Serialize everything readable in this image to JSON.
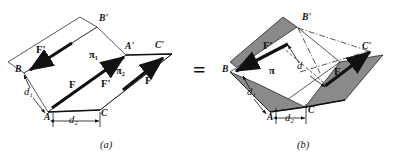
{
  "figure": {
    "type": "geometry-diagram",
    "relation_symbol": "=",
    "panels": [
      {
        "id": "a",
        "caption": "(a)",
        "planes": [
          {
            "name": "pi1",
            "label": "π₁"
          },
          {
            "name": "pi2",
            "label": "π₂"
          }
        ],
        "points": [
          {
            "label": "B'",
            "x": 100,
            "y": 20
          },
          {
            "label": "A'",
            "x": 127,
            "y": 48
          },
          {
            "label": "C'",
            "x": 156,
            "y": 47
          },
          {
            "label": "B",
            "x": 18,
            "y": 70
          },
          {
            "label": "A",
            "x": 46,
            "y": 113
          },
          {
            "label": "C",
            "x": 100,
            "y": 110
          }
        ],
        "vectors": [
          {
            "label": "F'",
            "at": "upper-left"
          },
          {
            "label": "F",
            "at": "middle-left"
          },
          {
            "label": "F'",
            "at": "middle-right"
          },
          {
            "label": "F",
            "at": "lower-right"
          }
        ],
        "distances": [
          {
            "label": "d₁"
          },
          {
            "label": "d₂"
          }
        ]
      },
      {
        "id": "b",
        "caption": "(b)",
        "planes": [
          {
            "name": "pi",
            "label": "π"
          }
        ],
        "points": [
          {
            "label": "B'",
            "x": 301,
            "y": 15
          },
          {
            "label": "C'",
            "x": 360,
            "y": 47
          },
          {
            "label": "B",
            "x": 224,
            "y": 70
          },
          {
            "label": "A",
            "x": 269,
            "y": 113
          },
          {
            "label": "C",
            "x": 307,
            "y": 106
          }
        ],
        "vectors": [
          {
            "label": "F'",
            "at": "upper-left"
          },
          {
            "label": "F",
            "at": "lower-right"
          }
        ],
        "distances": [
          {
            "label": "d₁"
          },
          {
            "label": "d₂"
          },
          {
            "label": "d"
          }
        ]
      }
    ],
    "colors": {
      "ink": "#111111",
      "shade": "#8a8a8a",
      "shade_light": "#a9a9a9",
      "background": "#ffffff"
    }
  }
}
